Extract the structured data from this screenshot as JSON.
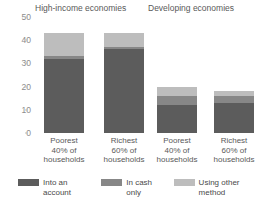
{
  "chart_data": {
    "type": "bar",
    "stacked": true,
    "title": "",
    "xlabel": "",
    "ylabel": "",
    "ylim": [
      0,
      50
    ],
    "yticks": [
      0,
      10,
      20,
      30,
      40,
      50
    ],
    "grid": false,
    "legend_position": "bottom",
    "groups": [
      {
        "label": "High-income economies"
      },
      {
        "label": "Developing economies"
      }
    ],
    "categories": [
      "Poorest\n40% of\nhouseholds",
      "Richest\n60% of\nhouseholds",
      "Poorest\n40% of\nhouseholds",
      "Richest\n60% of\nhouseholds"
    ],
    "category_lines": [
      [
        "Poorest",
        "40% of",
        "households"
      ],
      [
        "Richest",
        "60% of",
        "households"
      ],
      [
        "Poorest",
        "40% of",
        "households"
      ],
      [
        "Richest",
        "60% of",
        "households"
      ]
    ],
    "series": [
      {
        "name": "Into an account",
        "color": "#5c5c5c",
        "values": [
          32,
          36,
          12,
          13
        ]
      },
      {
        "name": "In cash only",
        "color": "#878787",
        "values": [
          1,
          1,
          4,
          3
        ]
      },
      {
        "name": "Using other method",
        "color": "#bdbdbd",
        "values": [
          10,
          6,
          4,
          2
        ]
      }
    ],
    "totals": [
      43,
      43,
      20,
      18
    ]
  },
  "legend": {
    "items": [
      {
        "label": "Into an account",
        "color": "#5c5c5c"
      },
      {
        "label": "In cash only",
        "color": "#878787"
      },
      {
        "label": "Using other method",
        "color": "#bdbdbd"
      }
    ]
  }
}
